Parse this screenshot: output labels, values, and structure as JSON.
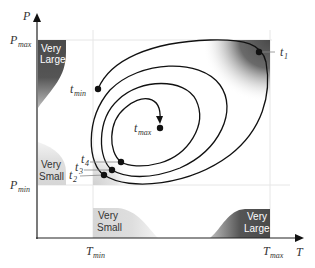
{
  "axes": {
    "x_label": "T",
    "y_label": "P",
    "x_ticks": [
      {
        "base": "T",
        "sub": "min"
      },
      {
        "base": "T",
        "sub": "max"
      }
    ],
    "y_ticks": [
      {
        "base": "P",
        "sub": "max"
      },
      {
        "base": "P",
        "sub": "min"
      }
    ]
  },
  "regions": {
    "p_very_large": {
      "line1": "Very",
      "line2": "Large"
    },
    "p_very_small": {
      "line1": "Very",
      "line2": "Small"
    },
    "t_very_small": {
      "line1": "Very",
      "line2": "Small"
    },
    "t_very_large": {
      "line1": "Very",
      "line2": "Large"
    }
  },
  "points": {
    "t1": {
      "base": "t",
      "sub": "1"
    },
    "t2": {
      "base": "t",
      "sub": "2"
    },
    "t3": {
      "base": "t",
      "sub": "3"
    },
    "t4": {
      "base": "t",
      "sub": "4"
    },
    "tmin": {
      "base": "t",
      "sub": "min"
    },
    "tmax": {
      "base": "t",
      "sub": "max"
    }
  },
  "colors": {
    "dark_region": "#4a4a4a",
    "light_region": "#d9d9d9",
    "curve": "#111111",
    "grid": "#e6e6e6"
  }
}
